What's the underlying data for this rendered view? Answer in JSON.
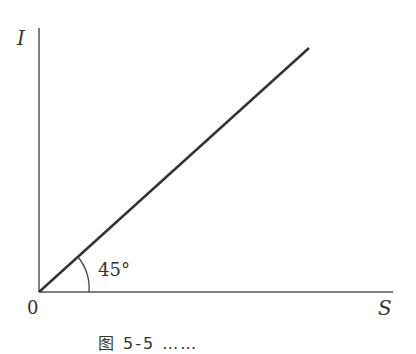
{
  "diagram": {
    "axes": {
      "y_label": "I",
      "x_label": "S",
      "origin_label": "0"
    },
    "line": {
      "description": "straight line through origin at 45 degrees",
      "angle_label": "45°"
    },
    "colors": {
      "axis": "#555555",
      "line": "#333333",
      "text": "#333333",
      "background": "#ffffff"
    },
    "caption": "图 5-5 ……"
  }
}
